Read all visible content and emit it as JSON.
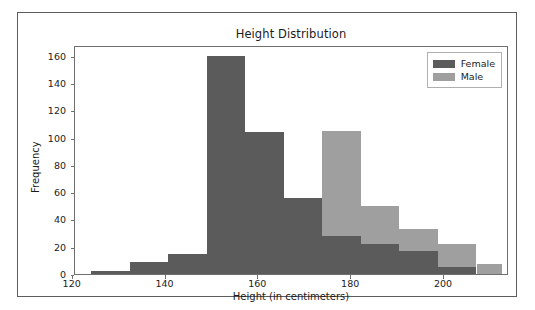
{
  "figure": {
    "background": "#ffffff",
    "border_color": "#5d5d5d"
  },
  "chart_data": {
    "type": "bar",
    "subtype": "histogram-overlay",
    "title": "Height Distribution",
    "xlabel": "Height (in centimeters)",
    "ylabel": "Frequency",
    "xlim": [
      120.5,
      214.0
    ],
    "ylim": [
      0,
      168
    ],
    "xticks": [
      120,
      140,
      160,
      180,
      200
    ],
    "yticks": [
      0,
      20,
      40,
      60,
      80,
      100,
      120,
      140,
      160
    ],
    "grid": false,
    "legend_position": "upper right",
    "bin_width": 8.3,
    "colors": {
      "female": "#5b5b5b",
      "male": "#9f9f9f"
    },
    "series": [
      {
        "name": "Female",
        "color": "#5b5b5b",
        "bins": [
          {
            "start": 124.0,
            "end": 132.3,
            "value": 2
          },
          {
            "start": 132.3,
            "end": 140.6,
            "value": 9
          },
          {
            "start": 140.6,
            "end": 148.9,
            "value": 15
          },
          {
            "start": 148.9,
            "end": 157.2,
            "value": 160
          },
          {
            "start": 157.2,
            "end": 165.5,
            "value": 104
          },
          {
            "start": 165.5,
            "end": 173.8,
            "value": 56
          },
          {
            "start": 173.8,
            "end": 182.1,
            "value": 28
          },
          {
            "start": 182.1,
            "end": 190.4,
            "value": 22
          },
          {
            "start": 190.4,
            "end": 198.7,
            "value": 17
          },
          {
            "start": 198.7,
            "end": 207.0,
            "value": 5
          }
        ]
      },
      {
        "name": "Male",
        "color": "#9f9f9f",
        "bins": [
          {
            "start": 157.2,
            "end": 165.5,
            "value": 0
          },
          {
            "start": 165.5,
            "end": 173.8,
            "value": 0
          },
          {
            "start": 173.8,
            "end": 182.1,
            "value": 105
          },
          {
            "start": 182.1,
            "end": 190.4,
            "value": 50
          },
          {
            "start": 190.4,
            "end": 198.7,
            "value": 33
          },
          {
            "start": 198.7,
            "end": 207.0,
            "value": 22
          },
          {
            "start": 207.0,
            "end": 212.5,
            "value": 7
          }
        ]
      }
    ]
  },
  "legend": {
    "items": [
      {
        "label": "Female",
        "color": "#5b5b5b"
      },
      {
        "label": "Male",
        "color": "#9f9f9f"
      }
    ]
  }
}
